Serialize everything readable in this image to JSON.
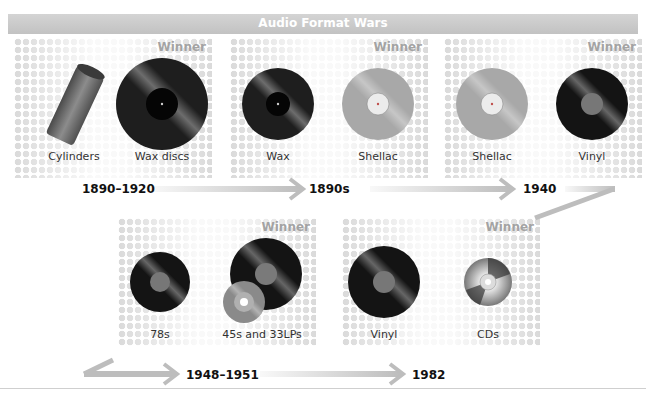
{
  "title": "Audio Format Wars",
  "winner_label": "Winner",
  "stages": [
    {
      "year": "1890–1920",
      "formats": [
        {
          "name": "Cylinders",
          "icon": "cylinder-icon"
        },
        {
          "name": "Wax discs",
          "icon": "wax-disc-icon",
          "winner": true
        }
      ]
    },
    {
      "year": "1890s",
      "formats": [
        {
          "name": "Wax",
          "icon": "wax-disc-icon"
        },
        {
          "name": "Shellac",
          "icon": "shellac-disc-icon",
          "winner": true
        }
      ]
    },
    {
      "year": "1940",
      "formats": [
        {
          "name": "Shellac",
          "icon": "shellac-disc-icon"
        },
        {
          "name": "Vinyl",
          "icon": "vinyl-disc-icon",
          "winner": true
        }
      ]
    },
    {
      "year": "1948–1951",
      "formats": [
        {
          "name": "78s",
          "icon": "vinyl-disc-icon"
        },
        {
          "name": "45s and 33LPs",
          "icon": "vinyl-45-33-icon",
          "winner": true
        }
      ]
    },
    {
      "year": "1982",
      "formats": [
        {
          "name": "Vinyl",
          "icon": "vinyl-disc-icon"
        },
        {
          "name": "CDs",
          "icon": "cd-icon",
          "winner": true
        }
      ]
    }
  ],
  "colors": {
    "title_bar": "#c8c8c8",
    "winner_text": "#a3a3a3",
    "arrow": "#bdbdbd",
    "vinyl": "#1a1a1a",
    "shellac": "#a8a8a8",
    "label_gray": "#8a8a8a"
  }
}
